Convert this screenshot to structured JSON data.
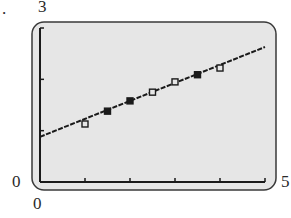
{
  "problem_label": ".",
  "window": {
    "ymax_label": "3",
    "ymin_label": "0",
    "xmin_label": "0",
    "xmax_label": "5"
  },
  "colors": {
    "screen_bg": "#e6e6e6",
    "frame": "#3a3a3a",
    "ink": "#1a1a1a"
  },
  "chart_data": {
    "type": "scatter",
    "title": "",
    "xlabel": "",
    "ylabel": "",
    "xlim": [
      0,
      5
    ],
    "ylim": [
      0,
      3
    ],
    "x_ticks": [
      0,
      1,
      2,
      3,
      4,
      5
    ],
    "y_ticks": [
      0,
      1,
      2,
      3
    ],
    "grid": false,
    "legend": null,
    "series": [
      {
        "name": "data points",
        "marker": "square",
        "points": [
          {
            "x": 1.0,
            "y": 1.13,
            "filled": false
          },
          {
            "x": 1.5,
            "y": 1.38,
            "filled": true
          },
          {
            "x": 2.0,
            "y": 1.58,
            "filled": true
          },
          {
            "x": 2.5,
            "y": 1.75,
            "filled": false
          },
          {
            "x": 3.0,
            "y": 1.95,
            "filled": false
          },
          {
            "x": 3.5,
            "y": 2.09,
            "filled": true
          },
          {
            "x": 4.0,
            "y": 2.22,
            "filled": false
          }
        ]
      },
      {
        "name": "regression line",
        "type": "line",
        "slope": 0.35,
        "intercept": 0.88,
        "x_range": [
          0,
          5
        ]
      }
    ]
  }
}
